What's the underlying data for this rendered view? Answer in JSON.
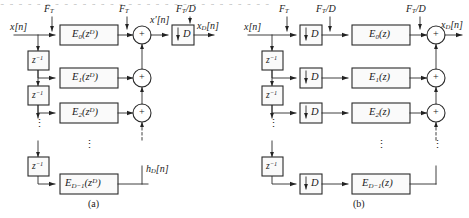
{
  "figure": {
    "top_cut_text": "a a a a a a a a a a a a a a a a a a a a a a a a a a a a a a",
    "captions": {
      "a": "(a)",
      "b": "(b)"
    }
  },
  "diagram_a": {
    "caption": "(a)",
    "input_label": "x[n]",
    "rate_labels": [
      {
        "id": "rate-a-input",
        "text": "F",
        "sub": "T",
        "suffix": ""
      },
      {
        "id": "rate-a-mid",
        "text": "F",
        "sub": "T",
        "suffix": ""
      },
      {
        "id": "rate-a-output",
        "text": "F",
        "sub": "T",
        "suffix": "/D"
      }
    ],
    "intermediate_label": "x′[n]",
    "output_label": "x",
    "output_sub": "D",
    "output_suffix": "[n]",
    "impulse_label": "h",
    "impulse_sub": "D",
    "impulse_suffix": "[n]",
    "delay_label": "z",
    "delay_exponent": "−1",
    "delay_count": 3,
    "downsampler_label": "D",
    "branches": [
      {
        "name": "E",
        "sub": "0",
        "arg": "z",
        "arg_exp": "D"
      },
      {
        "name": "E",
        "sub": "1",
        "arg": "z",
        "arg_exp": "D"
      },
      {
        "name": "E",
        "sub": "2",
        "arg": "z",
        "arg_exp": "D"
      },
      {
        "name": "E",
        "sub": "D−1",
        "arg": "z",
        "arg_exp": "D"
      }
    ],
    "adder_symbol": "+",
    "adder_count": 3,
    "vertical_dots": "⋮"
  },
  "diagram_b": {
    "caption": "(b)",
    "input_label": "x[n]",
    "rate_labels": [
      {
        "id": "rate-b-input",
        "text": "F",
        "sub": "T",
        "suffix": ""
      },
      {
        "id": "rate-b-mid",
        "text": "F",
        "sub": "T",
        "suffix": "/D"
      },
      {
        "id": "rate-b-output",
        "text": "F",
        "sub": "T",
        "suffix": "/D"
      }
    ],
    "output_label": "x",
    "output_sub": "D",
    "output_suffix": "[n]",
    "delay_label": "z",
    "delay_exponent": "−1",
    "delay_count": 3,
    "downsampler_label": "D",
    "downsampler_count": 4,
    "branches": [
      {
        "name": "E",
        "sub": "0",
        "arg": "z",
        "arg_exp": ""
      },
      {
        "name": "E",
        "sub": "1",
        "arg": "z",
        "arg_exp": ""
      },
      {
        "name": "E",
        "sub": "2",
        "arg": "z",
        "arg_exp": ""
      },
      {
        "name": "E",
        "sub": "D−1",
        "arg": "z",
        "arg_exp": ""
      }
    ],
    "adder_symbol": "+",
    "adder_count": 3,
    "vertical_dots": "⋮"
  }
}
